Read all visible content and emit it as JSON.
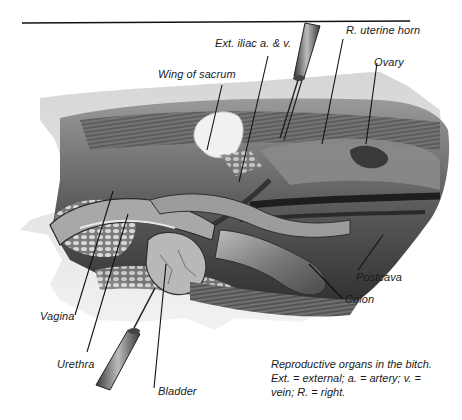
{
  "figure": {
    "type": "anatomical-illustration",
    "rule": {
      "x1": 22,
      "y1": 23,
      "x2": 410,
      "y2": 21
    },
    "labels": [
      {
        "id": "ext-iliac",
        "text": "Ext. iliac a. & v.",
        "x": 215,
        "y": 37,
        "line": [
          [
            268,
            56
          ],
          [
            239,
            182
          ]
        ]
      },
      {
        "id": "r-uterine-horn",
        "text": "R. uterine horn",
        "x": 346,
        "y": 24,
        "line": [
          [
            343,
            39
          ],
          [
            322,
            144
          ]
        ]
      },
      {
        "id": "ovary",
        "text": "Ovary",
        "x": 374,
        "y": 56,
        "line": [
          [
            377,
            63
          ],
          [
            366,
            144
          ]
        ]
      },
      {
        "id": "wing-of-sacrum",
        "text": "Wing of sacrum",
        "x": 158,
        "y": 68,
        "line": [
          [
            222,
            85
          ],
          [
            207,
            150
          ]
        ]
      },
      {
        "id": "postcava",
        "text": "Postcava",
        "x": 356,
        "y": 271,
        "line": [
          [
            383,
            235
          ],
          [
            358,
            270
          ]
        ]
      },
      {
        "id": "colon",
        "text": "Colon",
        "x": 345,
        "y": 293,
        "line": [
          [
            309,
            264
          ],
          [
            343,
            299
          ]
        ]
      },
      {
        "id": "vagina",
        "text": "Vagina",
        "x": 40,
        "y": 310,
        "line": [
          [
            113,
            191
          ],
          [
            75,
            315
          ]
        ]
      },
      {
        "id": "urethra",
        "text": "Urethra",
        "x": 57,
        "y": 358,
        "line": [
          [
            128,
            214
          ],
          [
            87,
            352
          ]
        ]
      },
      {
        "id": "bladder",
        "text": "Bladder",
        "x": 158,
        "y": 385,
        "line": [
          [
            166,
            264
          ],
          [
            154,
            388
          ]
        ]
      }
    ],
    "caption": {
      "line1": "Reproductive organs in the bitch.",
      "line2": "Ext. = external; a. = artery; v. =",
      "line3": "vein; R. = right."
    }
  }
}
